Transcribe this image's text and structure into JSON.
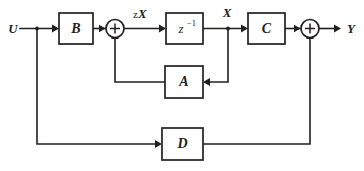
{
  "diagram": {
    "type": "block-diagram",
    "colors": {
      "line": "#231f20",
      "background": "#ffffff",
      "block_fill": "#ffffff"
    },
    "signals": {
      "input": "U",
      "output": "Y",
      "state_next": "zX",
      "state_next_prefix": "z",
      "state_next_main": "X",
      "state": "X"
    },
    "blocks": [
      {
        "id": "B",
        "label": "B",
        "role": "input-gain"
      },
      {
        "id": "delay",
        "label": "z",
        "exponent": "−1",
        "role": "unit-delay"
      },
      {
        "id": "C",
        "label": "C",
        "role": "output-gain"
      },
      {
        "id": "A",
        "label": "A",
        "role": "state-feedback-gain"
      },
      {
        "id": "D",
        "label": "D",
        "role": "feedthrough-gain"
      }
    ],
    "summers": [
      {
        "id": "sum-state",
        "operator": "+",
        "role": "state-summing-junction"
      },
      {
        "id": "sum-output",
        "operator": "+",
        "role": "output-summing-junction"
      }
    ]
  }
}
